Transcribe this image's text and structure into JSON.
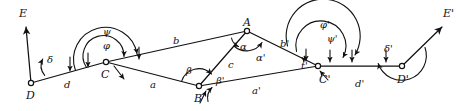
{
  "figure": {
    "kind": "geometric-traverse-diagram",
    "stroke_color": "#111111",
    "background_color": "#ffffff",
    "width": 460,
    "height": 111
  },
  "nodes": [
    {
      "id": "D",
      "label": "D",
      "x": 31,
      "y": 83,
      "label_x": 26,
      "label_y": 90,
      "open_circle": true
    },
    {
      "id": "C",
      "label": "C",
      "x": 106,
      "y": 62,
      "label_x": 101,
      "label_y": 69,
      "open_circle": true
    },
    {
      "id": "B",
      "label": "B",
      "x": 199,
      "y": 86,
      "label_x": 194,
      "label_y": 93,
      "open_circle": true
    },
    {
      "id": "A",
      "label": "A",
      "x": 247,
      "y": 31,
      "label_x": 243,
      "label_y": 17,
      "open_circle": true
    },
    {
      "id": "Cp",
      "label": "C'",
      "x": 318,
      "y": 66,
      "label_x": 319,
      "label_y": 74,
      "open_circle": true
    },
    {
      "id": "Dp",
      "label": "D'",
      "x": 402,
      "y": 66,
      "label_x": 397,
      "label_y": 74,
      "open_circle": true
    }
  ],
  "ray_endpoints": [
    {
      "id": "E",
      "label": "E",
      "x": 26,
      "y": 27,
      "label_x": 19,
      "label_y": 8
    },
    {
      "id": "Ep",
      "label": "E'",
      "x": 442,
      "y": 27,
      "label_x": 443,
      "label_y": 8
    }
  ],
  "edges": [
    {
      "id": "d",
      "label": "d",
      "from": "D",
      "to": "C",
      "label_x": 64,
      "label_y": 80
    },
    {
      "id": "a",
      "label": "a",
      "from": "C",
      "to": "B",
      "label_x": 150,
      "label_y": 80
    },
    {
      "id": "b",
      "label": "b",
      "from": "C",
      "to": "A",
      "label_x": 173,
      "label_y": 36
    },
    {
      "id": "c",
      "label": "c",
      "from": "B",
      "to": "A",
      "label_x": 228,
      "label_y": 60
    },
    {
      "id": "bp",
      "label": "b'",
      "from": "A",
      "to": "Cp",
      "label_x": 280,
      "label_y": 39
    },
    {
      "id": "ap",
      "label": "a'",
      "from": "B",
      "to": "Cp",
      "label_x": 252,
      "label_y": 86
    },
    {
      "id": "dp",
      "label": "d'",
      "from": "Cp",
      "to": "Dp",
      "label_x": 355,
      "label_y": 79
    },
    {
      "id": "DE",
      "label": "",
      "from": "D",
      "to": "E",
      "label_x": 0,
      "label_y": 0
    },
    {
      "id": "DpEp",
      "label": "",
      "from": "Dp",
      "to": "Ep",
      "label_x": 0,
      "label_y": 0
    }
  ],
  "angles": [
    {
      "id": "delta",
      "label": "δ",
      "at": "D",
      "label_x": 47,
      "label_y": 55
    },
    {
      "id": "psi",
      "label": "ψ",
      "at": "C",
      "label_x": 103,
      "label_y": 27,
      "arc": "outer"
    },
    {
      "id": "phi",
      "label": "φ",
      "at": "C",
      "label_x": 103,
      "label_y": 41,
      "arc": "inner"
    },
    {
      "id": "beta",
      "label": "β",
      "at": "B",
      "label_x": 186,
      "label_y": 66
    },
    {
      "id": "betap",
      "label": "β'",
      "at": "B",
      "label_x": 216,
      "label_y": 76
    },
    {
      "id": "alpha",
      "label": "α",
      "at": "A",
      "label_x": 240,
      "label_y": 42
    },
    {
      "id": "alphap",
      "label": "α'",
      "at": "A",
      "label_x": 256,
      "label_y": 53
    },
    {
      "id": "tp",
      "label": "t'",
      "at": "Cp",
      "label_x": 301,
      "label_y": 61
    },
    {
      "id": "phip",
      "label": "φ'",
      "at": "Cp",
      "label_x": 320,
      "label_y": 20,
      "arc": "outer"
    },
    {
      "id": "psip",
      "label": "ψ'",
      "at": "Cp",
      "label_x": 327,
      "label_y": 34,
      "arc": "inner"
    },
    {
      "id": "deltap",
      "label": "δ'",
      "at": "Dp",
      "label_x": 384,
      "label_y": 44
    }
  ]
}
